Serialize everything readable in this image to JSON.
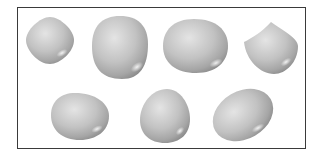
{
  "figure": {
    "shape_color": "#b8b8b8",
    "frame_color": "#3a3a3a",
    "rows": [
      {
        "shapes": [
          {
            "name": "rounded-diamond",
            "cx": 50,
            "cy": 40,
            "rx": 24,
            "ry": 24
          },
          {
            "name": "large-rounded-square",
            "cx": 120,
            "cy": 47,
            "rx": 27,
            "ry": 32
          },
          {
            "name": "wide-rounded-oval",
            "cx": 195,
            "cy": 46,
            "rx": 32,
            "ry": 27
          },
          {
            "name": "pointed-heart-like",
            "cx": 270,
            "cy": 47,
            "rx": 28,
            "ry": 28
          }
        ]
      },
      {
        "shapes": [
          {
            "name": "egg-horizontal",
            "cx": 80,
            "cy": 117,
            "rx": 29,
            "ry": 24
          },
          {
            "name": "egg-upright",
            "cx": 165,
            "cy": 116,
            "rx": 25,
            "ry": 27
          },
          {
            "name": "tilted-oval",
            "cx": 243,
            "cy": 114,
            "rx": 30,
            "ry": 26
          }
        ]
      }
    ]
  }
}
